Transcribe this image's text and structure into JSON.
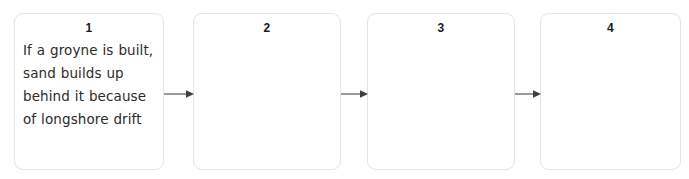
{
  "diagram": {
    "type": "sequence-flow",
    "orientation": "horizontal",
    "background_color": "#ffffff",
    "box_border_color": "#e4e4e4",
    "arrow_color": "#4a4a4a",
    "text_color": "#2b2b2b",
    "boxes": [
      {
        "number": "1",
        "text": "If a groyne is built, sand builds up behind it because of longshore drift",
        "filled": true
      },
      {
        "number": "2",
        "text": "",
        "filled": false
      },
      {
        "number": "3",
        "text": "",
        "filled": false
      },
      {
        "number": "4",
        "text": "",
        "filled": false
      }
    ],
    "arrows": [
      {
        "name": "arrow-1-to-2",
        "direction": "right"
      },
      {
        "name": "arrow-2-to-3",
        "direction": "right"
      },
      {
        "name": "arrow-3-to-4",
        "direction": "right"
      }
    ]
  }
}
